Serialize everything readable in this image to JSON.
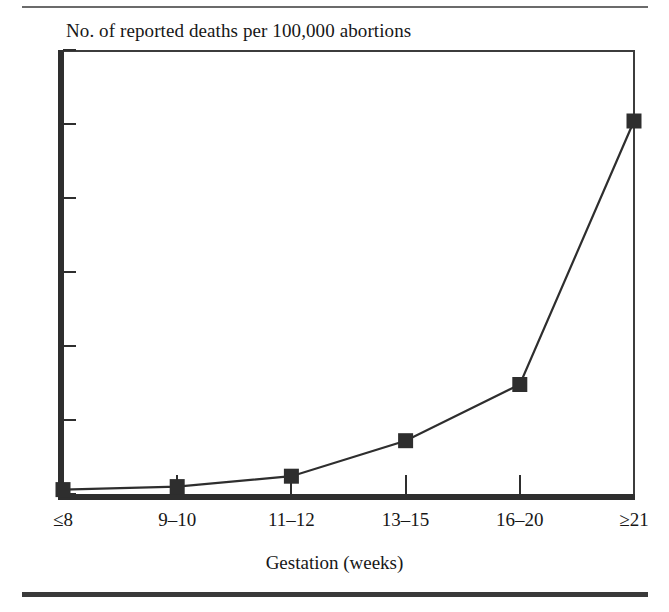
{
  "figure": {
    "rule_top": "horizontal-rule",
    "rule_bottom": "horizontal-rule"
  },
  "chart_data": {
    "type": "line",
    "title": "No. of reported deaths per 100,000 abortions",
    "xlabel": "Gestation (weeks)",
    "ylabel": "",
    "categories": [
      "≤8",
      "9–10",
      "11–12",
      "13–15",
      "16–20",
      "≥21"
    ],
    "values": [
      0.15,
      0.25,
      0.6,
      1.8,
      3.7,
      12.6
    ],
    "ylim": [
      0.0,
      15.0
    ],
    "ytick_labels": [
      "15.0",
      "12.5",
      "10.0",
      "7.5",
      "5.0",
      "2.5",
      "0.0"
    ],
    "ytick_values": [
      15.0,
      12.5,
      10.0,
      7.5,
      5.0,
      2.5,
      0.0
    ],
    "grid": false,
    "legend": false,
    "marker": "filled-square",
    "series_color": "#2e2e2e",
    "axis_color": "#2e2e2e",
    "background": "#ffffff"
  }
}
